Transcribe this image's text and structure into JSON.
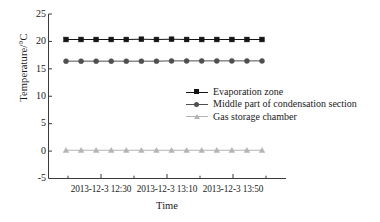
{
  "chart_data": {
    "type": "line",
    "title": "",
    "subtitle": "",
    "xlabel": "Time",
    "ylabel": "Temperature/°C",
    "ylim": [
      -5,
      25
    ],
    "yticks": [
      25,
      20,
      15,
      10,
      5,
      0,
      -5
    ],
    "ytick_labels": [
      "25",
      "20",
      "15",
      "10",
      "5",
      "0",
      "-5"
    ],
    "xtick_labels": [
      "2013-12-3 12:30",
      "2013-12-3 13:10",
      "2013-12-3 13:50"
    ],
    "x": [
      1,
      2,
      3,
      4,
      5,
      6,
      7,
      8,
      9,
      10,
      11,
      12,
      13,
      14
    ],
    "grid": false,
    "legend_position": "center-right",
    "series": [
      {
        "name": "Evaporation zone",
        "marker": "square",
        "color": "#141414",
        "values": [
          20.35,
          20.35,
          20.35,
          20.35,
          20.35,
          20.4,
          20.35,
          20.4,
          20.35,
          20.35,
          20.35,
          20.35,
          20.35,
          20.35
        ]
      },
      {
        "name": "Middle part of condensation section",
        "marker": "circle",
        "color": "#4f4f4f",
        "values": [
          16.4,
          16.4,
          16.4,
          16.4,
          16.4,
          16.4,
          16.4,
          16.45,
          16.45,
          16.45,
          16.45,
          16.45,
          16.45,
          16.45
        ]
      },
      {
        "name": "Gas storage chamber",
        "marker": "triangle",
        "color": "#b4b4b4",
        "values": [
          0.15,
          0.15,
          0.15,
          0.15,
          0.15,
          0.15,
          0.15,
          0.15,
          0.15,
          0.15,
          0.15,
          0.15,
          0.15,
          0.15
        ]
      }
    ]
  },
  "axis": {
    "ylabel": "Temperature/°C",
    "xlabel": "Time",
    "ytick_0": "25",
    "ytick_1": "20",
    "ytick_2": "15",
    "ytick_3": "10",
    "ytick_4": "5",
    "ytick_5": "0",
    "ytick_6": "-5",
    "xtick_0": "2013-12-3 12:30",
    "xtick_1": "2013-12-3 13:10",
    "xtick_2": "2013-12-3 13:50"
  },
  "legend": {
    "item_0": "Evaporation zone",
    "item_1": "Middle part of condensation section",
    "item_2": "Gas storage chamber"
  },
  "colors": {
    "series_0": "#141414",
    "series_1": "#4f4f4f",
    "series_2": "#b4b4b4",
    "axis": "#3a3a3a",
    "background": "#ffffff"
  }
}
